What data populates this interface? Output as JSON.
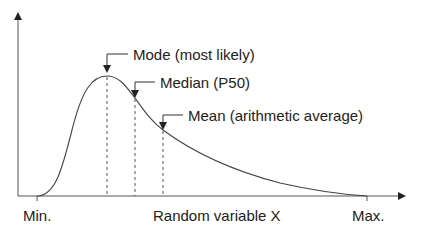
{
  "diagram": {
    "type": "probability-density-curve",
    "shape": "right-skewed (lognormal-like)",
    "annotations": [
      {
        "id": "mode",
        "label": "Mode (most likely)"
      },
      {
        "id": "median",
        "label": "Median (P50)"
      },
      {
        "id": "mean",
        "label": "Mean (arithmetic average)"
      }
    ],
    "x_axis": {
      "min_label": "Min.",
      "max_label": "Max.",
      "title": "Random variable X"
    },
    "colors": {
      "line": "#333333",
      "background": "#ffffff"
    }
  }
}
